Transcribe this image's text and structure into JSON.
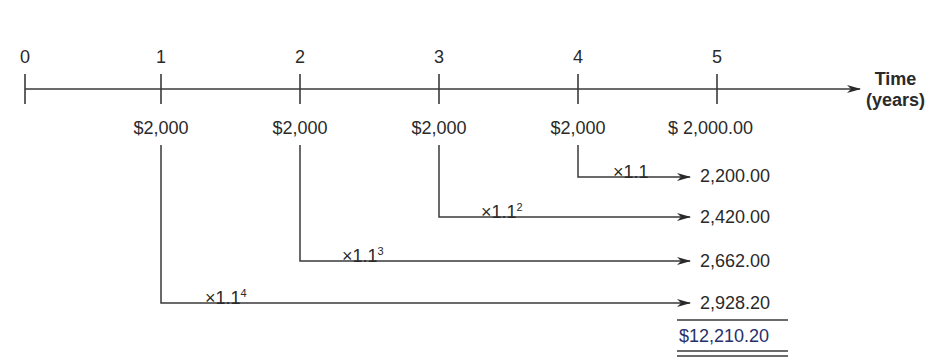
{
  "timeline": {
    "axis_label_line1": "Time",
    "axis_label_line2": "(years)",
    "ticks": [
      "0",
      "1",
      "2",
      "3",
      "4",
      "5"
    ]
  },
  "cash_flows": [
    {
      "period": "1",
      "amount": "$2,000"
    },
    {
      "period": "2",
      "amount": "$2,000"
    },
    {
      "period": "3",
      "amount": "$2,000"
    },
    {
      "period": "4",
      "amount": "$2,000"
    },
    {
      "period": "5",
      "amount": "$ 2,000.00"
    }
  ],
  "compounding": [
    {
      "from_period": "4",
      "factor": "×1.1",
      "exponent": "",
      "future_value": "2,200.00"
    },
    {
      "from_period": "3",
      "factor": "×1.1",
      "exponent": "2",
      "future_value": "2,420.00"
    },
    {
      "from_period": "2",
      "factor": "×1.1",
      "exponent": "3",
      "future_value": "2,662.00"
    },
    {
      "from_period": "1",
      "factor": "×1.1",
      "exponent": "4",
      "future_value": "2,928.20"
    }
  ],
  "total": "$12,210.20",
  "colors": {
    "line": "#3a3a3a",
    "total": "#27306b"
  }
}
